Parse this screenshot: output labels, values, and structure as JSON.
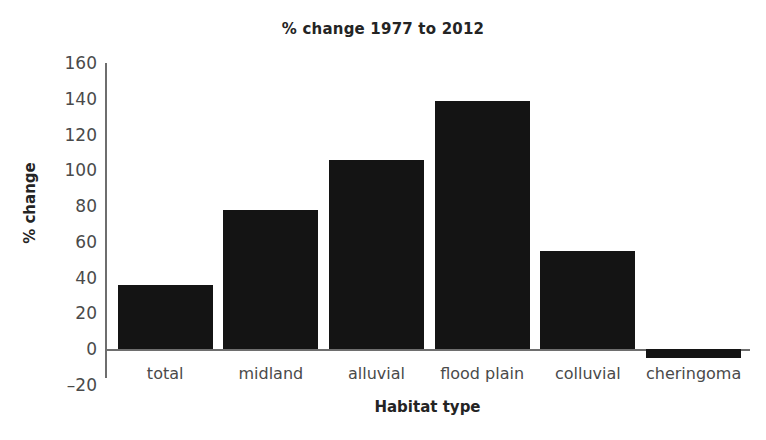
{
  "chart_data": {
    "type": "bar",
    "title": "% change 1977 to 2012",
    "xlabel": "Habitat type",
    "ylabel": "% change",
    "categories": [
      "total",
      "midland",
      "alluvial",
      "flood plain",
      "colluvial",
      "cheringoma"
    ],
    "values": [
      36,
      78,
      106,
      139,
      55,
      -5
    ],
    "ylim": [
      -20,
      160
    ],
    "yticks": [
      160,
      140,
      120,
      100,
      80,
      60,
      40,
      20,
      0,
      -20
    ],
    "ytick_labels": [
      "160",
      "140",
      "120",
      "100",
      "80",
      "60",
      "40",
      "20",
      "0",
      "–20"
    ],
    "grid": false,
    "legend": false,
    "bar_color": "#141414",
    "axis_color": "#6e6e6e",
    "text_color": "#4a4a4a",
    "background": "#ffffff"
  }
}
